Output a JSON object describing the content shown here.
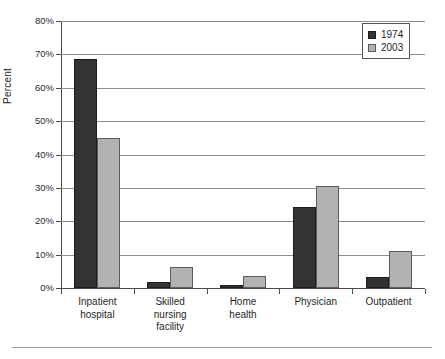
{
  "chart_data": {
    "type": "bar",
    "title": "",
    "subtitle": "",
    "xlabel": "",
    "ylabel": "Percent",
    "ylim": [
      0,
      80
    ],
    "ytick_values": [
      0,
      10,
      20,
      30,
      40,
      50,
      60,
      70,
      80
    ],
    "ytick_labels": [
      "0%",
      "10%",
      "20%",
      "30%",
      "40%",
      "50%",
      "60%",
      "70%",
      "80%"
    ],
    "grid": true,
    "legend_position": "top-right",
    "categories": [
      "Inpatient\nhospital",
      "Skilled\nnursing\nfacility",
      "Home\nhealth",
      "Physician",
      "Outpatient"
    ],
    "series": [
      {
        "name": "1974",
        "color": "#333333",
        "values": [
          68.7,
          1.8,
          0.8,
          24.2,
          3.2
        ]
      },
      {
        "name": "2003",
        "color": "#b2b2b2",
        "values": [
          44.8,
          6.2,
          3.7,
          30.6,
          11.0
        ]
      }
    ]
  }
}
